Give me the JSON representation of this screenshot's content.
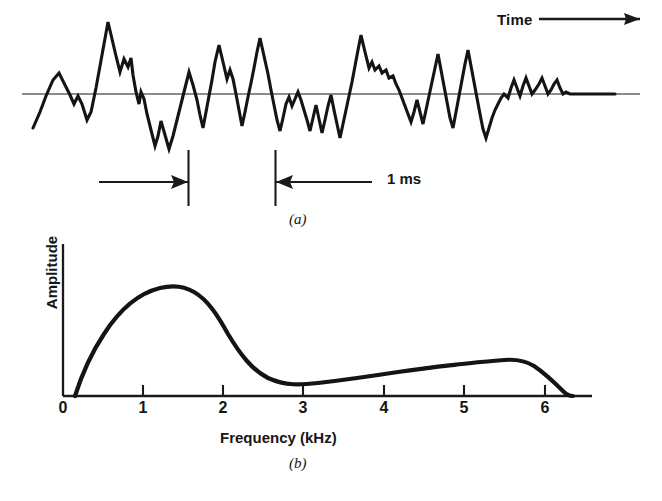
{
  "figure": {
    "panel_a": {
      "id_label": "(a)",
      "axis_arrow_label": "Time",
      "duration_annotation": "1 ms",
      "description": "time-domain speech waveform with horizontal zero-axis, damped irregular oscillations decaying left to right",
      "baseline_y": 94,
      "waveform_points": "33,128 40,112 46,96 53,80 59,73 65,85 70,95 74,104 78,96 82,104 87,120 91,112 96,88 100,66 104,44 108,22 112,39 116,56 120,72 124,59 128,67 131,58 133,75 136,92 139,104 141,92 144,99 147,114 151,130 155,146 158,136 161,121 165,135 169,149 173,136 177,120 181,104 185,88 189,72 193,85 197,100 200,115 203,128 206,112 209,96 212,80 215,62 219,45 223,62 227,79 230,70 233,79 236,94 239,110 242,126 245,112 248,97 251,83 254,68 257,52 260,38 264,56 268,74 271,90 274,105 277,120 280,131 283,118 286,104 289,97 292,106 295,99 298,92 301,100 304,110 307,120 310,131 313,118 316,105 319,119 322,133 325,120 328,106 331,95 334,110 337,124 340,138 343,124 346,110 349,96 352,82 355,66 358,50 361,35 365,52 369,68 372,62 375,70 379,66 382,73 386,70 389,78 393,76 396,84 399,90 402,98 405,106 408,114 411,122 414,112 417,100 420,112 423,124 426,110 429,96 432,82 435,68 438,54 441,70 444,86 447,102 450,118 453,128 456,112 459,96 462,80 465,64 468,50 471,66 474,82 477,98 480,114 483,129 486,138 489,128 492,118 495,110 498,104 501,98 504,94 508,98 511,88 514,80 517,88 520,96 523,86 526,78 529,86 532,94 535,90 539,84 542,78 545,86 548,94 551,90 554,84 557,80 560,88 563,94 566,92 570,94 592,94 615,94"
    },
    "panel_b": {
      "id_label": "(b)",
      "ylabel": "Amplitude",
      "xlabel": "Frequency (kHz)",
      "description": "smooth broadband spectral envelope rising steeply to a peak near 1.4 kHz and decaying to zero near 6.3 kHz"
    }
  },
  "chart_data": [
    {
      "type": "line",
      "title": "",
      "subtitle": "(a)",
      "xlabel": "Time",
      "ylabel": "",
      "grid": false,
      "legend": "none",
      "annotations": [
        {
          "text": "Time",
          "kind": "axis-direction-arrow",
          "position": "top-right"
        },
        {
          "text": "1 ms",
          "kind": "interval-measure",
          "position": "below-waveform",
          "value": 1,
          "unit": "ms"
        }
      ],
      "notes": "Time-domain fricative/plosive speech waveform; zero reference line drawn horizontally; interval markers delimit a 1 ms span."
    },
    {
      "type": "line",
      "title": "",
      "subtitle": "(b)",
      "xlabel": "Frequency (kHz)",
      "ylabel": "Amplitude",
      "grid": false,
      "legend": "none",
      "xlim": [
        0,
        6.6
      ],
      "ylim": [
        0,
        1.05
      ],
      "xticks": [
        0,
        1,
        2,
        3,
        4,
        5,
        6
      ],
      "xtick_labels": [
        "0",
        "1",
        "2",
        "3",
        "4",
        "5",
        "6"
      ],
      "yticks": [],
      "ytick_labels": [],
      "x": [
        0.15,
        0.3,
        0.45,
        0.6,
        0.8,
        1.0,
        1.2,
        1.4,
        1.45,
        1.6,
        1.8,
        2.0,
        2.2,
        2.4,
        2.6,
        2.8,
        3.0,
        3.2,
        3.4,
        3.6,
        3.8,
        4.0,
        4.2,
        4.4,
        4.6,
        4.8,
        5.0,
        5.2,
        5.4,
        5.6,
        5.8,
        6.0,
        6.15,
        6.25,
        6.32
      ],
      "values": [
        0.0,
        0.24,
        0.42,
        0.56,
        0.72,
        0.85,
        0.93,
        0.965,
        0.97,
        0.955,
        0.9,
        0.84,
        0.76,
        0.69,
        0.62,
        0.56,
        0.5,
        0.455,
        0.42,
        0.39,
        0.365,
        0.345,
        0.33,
        0.32,
        0.315,
        0.312,
        0.308,
        0.295,
        0.275,
        0.245,
        0.205,
        0.155,
        0.1,
        0.045,
        0.0
      ],
      "notes": "Amplitude axis unlabeled (relative units); peak amplitude at about 1.45 kHz; slight plateau/shelf between 4.4 and 5.0 kHz; curve returns to zero at about 6.3 kHz."
    }
  ]
}
